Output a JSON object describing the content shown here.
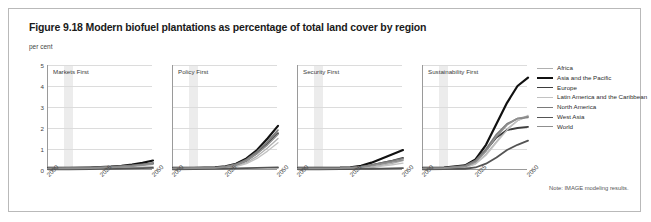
{
  "figure": {
    "title": "Figure 9.18 Modern biofuel plantations as percentage of total land cover by region",
    "unit_label": "per cent",
    "note": "Note: IMAGE modeling results."
  },
  "legend": {
    "position": "right",
    "entries": [
      {
        "label": "Africa",
        "color": "#b0b0b0",
        "width": 1.3
      },
      {
        "label": "Asia and the Pacific",
        "color": "#111111",
        "width": 2.2
      },
      {
        "label": "Europe",
        "color": "#3d3d3d",
        "width": 1.8
      },
      {
        "label": "Latin America and the Caribbean",
        "color": "#c2c2c2",
        "width": 1.3
      },
      {
        "label": "North America",
        "color": "#7a7a7a",
        "width": 1.6
      },
      {
        "label": "West Asia",
        "color": "#545454",
        "width": 1.8
      },
      {
        "label": "World",
        "color": "#8f8f8f",
        "width": 1.6
      }
    ]
  },
  "chart_data": {
    "type": "line",
    "title": "Figure 9.18 Modern biofuel plantations as percentage of total land cover by region",
    "xlabel": "",
    "ylabel": "per cent",
    "ylim": [
      0,
      5
    ],
    "yticks": [
      0,
      1,
      2,
      3,
      4,
      5
    ],
    "xlim": [
      2000,
      2050
    ],
    "xticks": [
      2000,
      2025,
      2050
    ],
    "xtick_labels": [
      "2000",
      "2025",
      "2050"
    ],
    "grid": true,
    "shaded_band": [
      2008,
      2012
    ],
    "x": [
      2000,
      2010,
      2020,
      2025,
      2030,
      2035,
      2040,
      2045,
      2050
    ],
    "panels": [
      {
        "title": "Markets First",
        "series": [
          {
            "name": "Africa",
            "values": [
              0.05,
              0.05,
              0.06,
              0.07,
              0.08,
              0.1,
              0.12,
              0.14,
              0.16
            ]
          },
          {
            "name": "Asia and the Pacific",
            "values": [
              0.1,
              0.1,
              0.12,
              0.14,
              0.16,
              0.2,
              0.26,
              0.34,
              0.45
            ]
          },
          {
            "name": "Europe",
            "values": [
              0.08,
              0.09,
              0.1,
              0.12,
              0.14,
              0.17,
              0.21,
              0.26,
              0.32
            ]
          },
          {
            "name": "Latin America and the Caribbean",
            "values": [
              0.04,
              0.04,
              0.05,
              0.06,
              0.07,
              0.08,
              0.1,
              0.12,
              0.14
            ]
          },
          {
            "name": "North America",
            "values": [
              0.09,
              0.1,
              0.12,
              0.14,
              0.16,
              0.19,
              0.22,
              0.27,
              0.33
            ]
          },
          {
            "name": "West Asia",
            "values": [
              0.03,
              0.03,
              0.04,
              0.05,
              0.06,
              0.07,
              0.08,
              0.09,
              0.1
            ]
          },
          {
            "name": "World",
            "values": [
              0.07,
              0.07,
              0.08,
              0.1,
              0.12,
              0.15,
              0.18,
              0.23,
              0.28
            ]
          }
        ]
      },
      {
        "title": "Policy First",
        "series": [
          {
            "name": "Africa",
            "values": [
              0.05,
              0.05,
              0.07,
              0.1,
              0.18,
              0.35,
              0.65,
              1.05,
              1.5
            ]
          },
          {
            "name": "Asia and the Pacific",
            "values": [
              0.1,
              0.1,
              0.13,
              0.18,
              0.3,
              0.55,
              0.95,
              1.5,
              2.1
            ]
          },
          {
            "name": "Europe",
            "values": [
              0.08,
              0.09,
              0.11,
              0.15,
              0.25,
              0.45,
              0.8,
              1.25,
              1.75
            ]
          },
          {
            "name": "Latin America and the Caribbean",
            "values": [
              0.04,
              0.05,
              0.06,
              0.09,
              0.16,
              0.3,
              0.55,
              0.9,
              1.3
            ]
          },
          {
            "name": "North America",
            "values": [
              0.09,
              0.1,
              0.12,
              0.17,
              0.28,
              0.5,
              0.88,
              1.35,
              1.9
            ]
          },
          {
            "name": "West Asia",
            "values": [
              0.03,
              0.04,
              0.05,
              0.07,
              0.08,
              0.09,
              0.1,
              0.11,
              0.12
            ]
          },
          {
            "name": "World",
            "values": [
              0.07,
              0.08,
              0.1,
              0.14,
              0.24,
              0.44,
              0.78,
              1.2,
              1.7
            ]
          }
        ]
      },
      {
        "title": "Security First",
        "series": [
          {
            "name": "Africa",
            "values": [
              0.05,
              0.05,
              0.06,
              0.07,
              0.09,
              0.14,
              0.22,
              0.32,
              0.45
            ]
          },
          {
            "name": "Asia and the Pacific",
            "values": [
              0.1,
              0.1,
              0.11,
              0.13,
              0.2,
              0.35,
              0.55,
              0.75,
              0.95
            ]
          },
          {
            "name": "Europe",
            "values": [
              0.08,
              0.08,
              0.09,
              0.11,
              0.15,
              0.23,
              0.34,
              0.45,
              0.58
            ]
          },
          {
            "name": "Latin America and the Caribbean",
            "values": [
              0.04,
              0.04,
              0.05,
              0.06,
              0.08,
              0.12,
              0.18,
              0.25,
              0.33
            ]
          },
          {
            "name": "North America",
            "values": [
              0.09,
              0.09,
              0.1,
              0.12,
              0.16,
              0.24,
              0.34,
              0.44,
              0.55
            ]
          },
          {
            "name": "West Asia",
            "values": [
              0.03,
              0.03,
              0.04,
              0.04,
              0.05,
              0.06,
              0.07,
              0.08,
              0.09
            ]
          },
          {
            "name": "World",
            "values": [
              0.07,
              0.07,
              0.08,
              0.1,
              0.13,
              0.2,
              0.29,
              0.38,
              0.48
            ]
          }
        ]
      },
      {
        "title": "Sustainability First",
        "series": [
          {
            "name": "Africa",
            "values": [
              0.05,
              0.06,
              0.12,
              0.3,
              0.75,
              1.35,
              1.95,
              2.35,
              2.55
            ]
          },
          {
            "name": "Asia and the Pacific",
            "values": [
              0.1,
              0.12,
              0.22,
              0.5,
              1.2,
              2.2,
              3.2,
              4.0,
              4.4
            ]
          },
          {
            "name": "Europe",
            "values": [
              0.08,
              0.1,
              0.18,
              0.42,
              0.95,
              1.55,
              1.9,
              2.0,
              2.05
            ]
          },
          {
            "name": "Latin America and the Caribbean",
            "values": [
              0.04,
              0.05,
              0.1,
              0.28,
              0.7,
              1.3,
              1.9,
              2.35,
              2.6
            ]
          },
          {
            "name": "North America",
            "values": [
              0.09,
              0.11,
              0.2,
              0.45,
              1.0,
              1.7,
              2.2,
              2.45,
              2.5
            ]
          },
          {
            "name": "West Asia",
            "values": [
              0.03,
              0.04,
              0.06,
              0.12,
              0.3,
              0.6,
              0.95,
              1.2,
              1.4
            ]
          },
          {
            "name": "World",
            "values": [
              0.07,
              0.09,
              0.16,
              0.38,
              0.9,
              1.6,
              2.15,
              2.45,
              2.55
            ]
          }
        ]
      }
    ]
  }
}
